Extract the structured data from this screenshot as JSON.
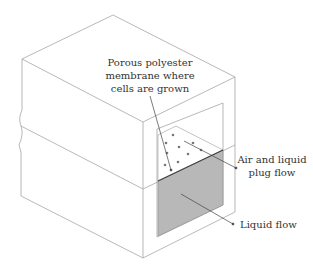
{
  "diagram": {
    "type": "isometric cross-section of microfluidic channel block",
    "labels": {
      "membrane_line1": "Porous polyester",
      "membrane_line2": "membrane where",
      "membrane_line3": "cells are grown",
      "air_line1": "Air and liquid",
      "air_line2": "plug flow",
      "liquid": "Liquid flow"
    },
    "colors": {
      "outline": "#9a9a9a",
      "liquid_fill": "#b8b8b8",
      "dots": "#777777",
      "text": "#333333"
    }
  }
}
